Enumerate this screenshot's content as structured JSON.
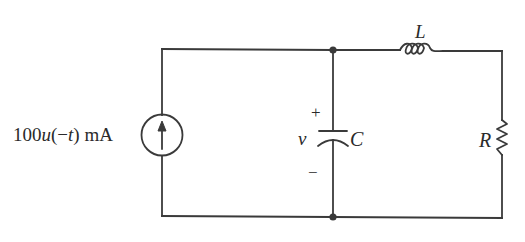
{
  "diagram": {
    "type": "circuit-schematic",
    "components": {
      "source": {
        "kind": "current-source",
        "label_parts": {
          "coef": "100",
          "func": "u",
          "arg": "(−",
          "var": "t",
          "close": ")",
          "unit": " mA"
        },
        "label": "100u(−t) mA",
        "direction": "up"
      },
      "capacitor": {
        "kind": "capacitor",
        "label": "C",
        "voltage_label": "v",
        "plus": "+",
        "minus": "−"
      },
      "inductor": {
        "kind": "inductor",
        "label": "L"
      },
      "resistor": {
        "kind": "resistor",
        "label": "R"
      }
    },
    "nodes": [
      {
        "name": "top-junction",
        "at": "capacitor-top"
      },
      {
        "name": "bottom-junction",
        "at": "capacitor-bottom"
      }
    ],
    "colors": {
      "line": "#3a3a3a",
      "text": "#2a2a2a",
      "background": "#ffffff"
    }
  }
}
